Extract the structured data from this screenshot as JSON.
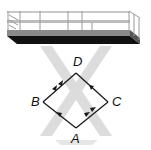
{
  "figure": {
    "vertices": [
      {
        "label": "A",
        "x": 76,
        "y": 128
      },
      {
        "label": "B",
        "x": 43,
        "y": 102
      },
      {
        "label": "C",
        "x": 108,
        "y": 102
      },
      {
        "label": "D",
        "x": 76,
        "y": 73
      }
    ],
    "edges": [
      {
        "from": "A",
        "to": "B",
        "arrows": 1
      },
      {
        "from": "B",
        "to": "D",
        "arrows": 2
      },
      {
        "from": "A",
        "to": "C",
        "arrows": 2
      },
      {
        "from": "C",
        "to": "D",
        "arrows": 1
      }
    ],
    "labels": {
      "A": "A",
      "B": "B",
      "C": "C",
      "D": "D"
    },
    "colors": {
      "line": "#1a1a1a",
      "arm": "#d9d9d9",
      "platform_base": "#111111",
      "platform_rail": "#9a9a9a"
    }
  }
}
